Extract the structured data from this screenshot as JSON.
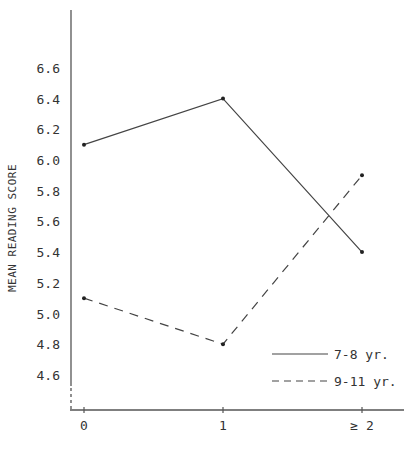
{
  "chart_data": {
    "type": "line",
    "title": "",
    "xlabel": "",
    "ylabel": "Mean Reading Score",
    "categories": [
      "0",
      "1",
      "≥ 2"
    ],
    "series": [
      {
        "name": "7-8 yr.",
        "values": [
          6.1,
          6.4,
          5.4
        ],
        "style": "solid"
      },
      {
        "name": "9-11 yr.",
        "values": [
          5.1,
          4.8,
          5.9
        ],
        "style": "dashed"
      }
    ],
    "y_ticks": [
      4.6,
      4.8,
      5.0,
      5.2,
      5.4,
      5.6,
      5.8,
      6.0,
      6.2,
      6.4,
      6.6
    ],
    "ylim": [
      4.4,
      6.9
    ],
    "y_axis_break": true,
    "grid": false,
    "legend_position": "lower right",
    "colors": {
      "line": "#444444",
      "axis": "#555555",
      "text": "#333333"
    }
  },
  "labels": {
    "y_axis_title": "MEAN READING SCORE",
    "legend": [
      "7-8 yr.",
      "9-11 yr."
    ]
  }
}
